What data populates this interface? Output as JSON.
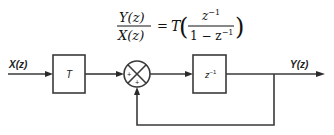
{
  "equation": {
    "lhs_numerator": "Y(z)",
    "lhs_denominator": "X(z)",
    "equals": "=",
    "gain": "T",
    "rhs_numerator": "z",
    "rhs_numerator_exponent": "−1",
    "rhs_denominator_prefix": "1 − z",
    "rhs_denominator_exponent": "−1",
    "left_paren": "(",
    "right_paren": ")"
  },
  "blocks": {
    "gain_block": {
      "label": "T"
    },
    "delay_block": {
      "label": "z",
      "exponent": "−1"
    }
  },
  "summing_junction": {
    "input_sign_left": "+",
    "input_sign_bottom": "+"
  },
  "signals": {
    "input": "X(z)",
    "output": "Y(z)"
  }
}
